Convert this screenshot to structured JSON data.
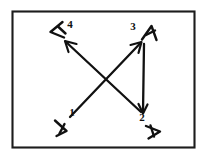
{
  "figure": {
    "background_color": "#ffffff",
    "ink_color": "#111111",
    "frame": {
      "name": "border-rectangle",
      "x": 12,
      "y": 11,
      "width": 183,
      "height": 137,
      "stroke_color": "#1c1c1c"
    },
    "labels": [
      {
        "id": "label-1",
        "text": "1",
        "x": 72,
        "y": 113
      },
      {
        "id": "label-2",
        "text": "2",
        "x": 142,
        "y": 117
      },
      {
        "id": "label-3",
        "text": "3",
        "x": 133,
        "y": 27
      },
      {
        "id": "label-4",
        "text": "4",
        "x": 70,
        "y": 25
      }
    ],
    "nodes": [
      {
        "id": "node-1",
        "label": "1",
        "corner": "bottom-left",
        "x": 60,
        "y": 128
      },
      {
        "id": "node-2",
        "label": "2",
        "corner": "bottom-right",
        "x": 152,
        "y": 131
      },
      {
        "id": "node-3",
        "label": "3",
        "corner": "top-right",
        "x": 148,
        "y": 33
      },
      {
        "id": "node-4",
        "label": "4",
        "corner": "top-left",
        "x": 56,
        "y": 30
      }
    ],
    "arrows": [
      {
        "id": "arrow-1-to-3",
        "from": "1",
        "to": "3",
        "kind": "diagonal-up-right"
      },
      {
        "id": "arrow-2-to-4",
        "from": "2",
        "to": "4",
        "kind": "diagonal-up-left"
      },
      {
        "id": "arrow-3-to-2",
        "from": "3",
        "to": "2",
        "kind": "vertical-down"
      }
    ]
  }
}
